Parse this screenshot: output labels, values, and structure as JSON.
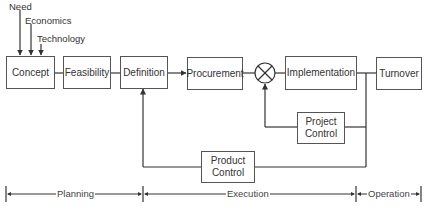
{
  "diagram": {
    "inputs": [
      {
        "label": "Need"
      },
      {
        "label": "Economics"
      },
      {
        "label": "Technology"
      }
    ],
    "blocks": {
      "concept": "Concept",
      "feasibility": "Feasibility",
      "definition": "Definition",
      "procurement": "Procurement",
      "implementation": "Implementation",
      "turnover": "Turnover",
      "project_control": "Project Control",
      "product_control": "Product Control"
    },
    "summing_junction": {
      "symbol": "⊗"
    },
    "phases": [
      {
        "label": "Planning"
      },
      {
        "label": "Execution"
      },
      {
        "label": "Operation"
      }
    ],
    "colors": {
      "line": "#333333",
      "box_border": "#555555",
      "text": "#333333",
      "background": "#ffffff"
    }
  }
}
